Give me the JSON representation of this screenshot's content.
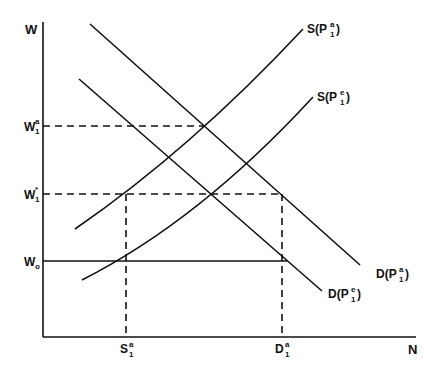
{
  "diagram": {
    "axes": {
      "y_label": "W",
      "x_label": "N"
    },
    "y_ticks": [
      {
        "id": "w1a",
        "base": "W",
        "sup": "a",
        "sub": "1",
        "y": 126
      },
      {
        "id": "w1star",
        "base": "W",
        "sup": "*",
        "sub": "1",
        "y": 194
      },
      {
        "id": "w0",
        "base": "W",
        "sup": "",
        "sub": "o",
        "y": 261
      }
    ],
    "x_ticks": [
      {
        "id": "s1a",
        "base": "S",
        "sup": "a",
        "sub": "1",
        "x": 126
      },
      {
        "id": "d1a",
        "base": "D",
        "sup": "a",
        "sub": "1",
        "x": 282
      }
    ],
    "curves": [
      {
        "id": "supply-pa",
        "label_base": "S(P",
        "sup": "a",
        "sub": "1",
        "label_close": ")",
        "type": "supply"
      },
      {
        "id": "supply-pe",
        "label_base": "S(P",
        "sup": "e",
        "sub": "1",
        "label_close": ")",
        "type": "supply"
      },
      {
        "id": "demand-pa",
        "label_base": "D(P",
        "sup": "a",
        "sub": "1",
        "label_close": ")",
        "type": "demand"
      },
      {
        "id": "demand-pe",
        "label_base": "D(P",
        "sup": "e",
        "sub": "1",
        "label_close": ")",
        "type": "demand"
      }
    ],
    "line_color": "#111111"
  }
}
